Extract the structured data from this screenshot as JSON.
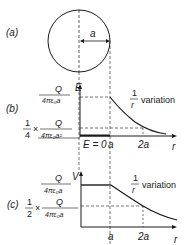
{
  "panel_a": {
    "label": "(a)",
    "radius_label": "a"
  },
  "panel_b": {
    "label": "(b)",
    "y_axis_label": "E",
    "x_axis_label": "r",
    "y_tick_top_num": "Q",
    "y_tick_top_den": "4πε₀a",
    "y_tick_low_prefix_num": "1",
    "y_tick_low_prefix_den": "4",
    "y_tick_low_times": "×",
    "y_tick_low_num": "Q",
    "y_tick_low_den": "4πε₀a²",
    "x_tick_inside": "E = 0",
    "x_tick_a": "a",
    "x_tick_2a": "2a",
    "annotation_num": "1",
    "annotation_den": "r",
    "annotation_text": "variation"
  },
  "panel_c": {
    "label": "(c)",
    "y_axis_label": "V",
    "x_axis_label": "r",
    "y_tick_top_num": "Q",
    "y_tick_top_den": "4πε₀a",
    "y_tick_low_prefix_num": "1",
    "y_tick_low_prefix_den": "2",
    "y_tick_low_times": "×",
    "y_tick_low_num": "Q",
    "y_tick_low_den": "4πε₀a",
    "x_tick_a": "a",
    "x_tick_2a": "2a",
    "annotation_num": "1",
    "annotation_den": "r",
    "annotation_text": "variation"
  }
}
